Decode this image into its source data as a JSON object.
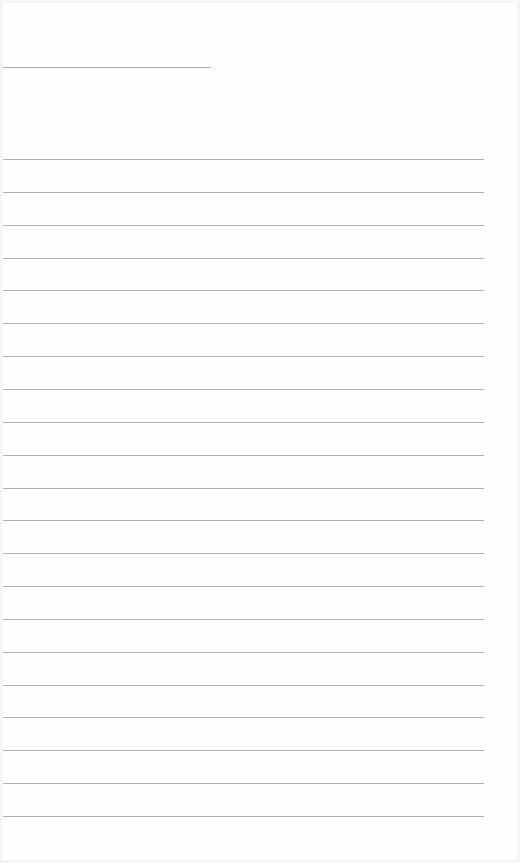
{
  "page": {
    "type": "blank lined sheet",
    "background": "#fefefe",
    "rule_color": "#b0b0b0"
  },
  "title_rule": {
    "x": 3,
    "y": 67,
    "width": 208
  },
  "ruled_lines": {
    "count": 21,
    "first_y": 159,
    "spacing": 32.85,
    "x": 3,
    "width": 481
  }
}
